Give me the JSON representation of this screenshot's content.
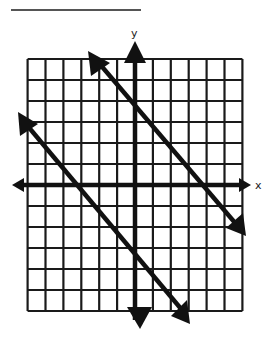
{
  "title": "",
  "answer_blank": {
    "value": ""
  },
  "graph": {
    "x_axis_label": "x",
    "y_axis_label": "y",
    "grid": {
      "x_min": -6,
      "x_max": 6,
      "y_min": -6,
      "y_max": 6,
      "step": 1,
      "tick_labels_shown": false
    },
    "lines": [
      {
        "name": "upper-line",
        "slope": -1,
        "y_intercept": 4,
        "equation": "y = -x + 4",
        "arrows": "both"
      },
      {
        "name": "lower-line",
        "slope": -1,
        "y_intercept": -3,
        "equation": "y = -x - 3",
        "arrows": "both"
      }
    ],
    "relationship": "parallel"
  },
  "colors": {
    "grid": "#1a1a1a",
    "axis": "#111111",
    "line": "#111111",
    "background": "#ffffff"
  }
}
